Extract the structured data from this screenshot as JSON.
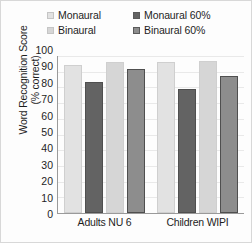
{
  "chart_data": {
    "type": "bar",
    "title": "",
    "xlabel": "",
    "ylabel": "Word Recognition Score\n(% correct)",
    "ylabel_line1": "Word Recognition Score",
    "ylabel_line2": "(% correct)",
    "categories": [
      "Adults NU 6",
      "Children WIPI"
    ],
    "ylim": [
      0,
      100
    ],
    "ytick_step": 10,
    "yticks": [
      100,
      90,
      80,
      70,
      60,
      50,
      40,
      30,
      20,
      10,
      0
    ],
    "grid": true,
    "legend_position": "top",
    "series": [
      {
        "name": "Monaural",
        "color": "#e2e2e2",
        "values": [
          94.5,
          96.0
        ]
      },
      {
        "name": "Monaural 60%",
        "color": "#636363",
        "values": [
          83.5,
          79.0
        ]
      },
      {
        "name": "Binaural",
        "color": "#d6d6d6",
        "values": [
          96.0,
          97.0
        ]
      },
      {
        "name": "Binaural 60%",
        "color": "#8d8d8d",
        "values": [
          91.5,
          87.0
        ]
      }
    ]
  }
}
